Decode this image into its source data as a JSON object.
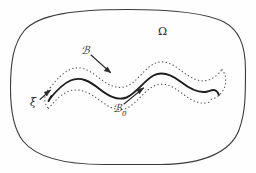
{
  "figure": {
    "kind": "mathematical-diagram",
    "caption_text": "",
    "background_color": "#fefefe",
    "stroke_color": "#3a3a3a",
    "dotted_color": "#5a5a5a",
    "label_color": "#2b2b2b",
    "labels": {
      "domain": "Ω",
      "tube": "ℬ",
      "curve": "ℬ",
      "curve_subscript": "0",
      "point": "ξ"
    },
    "label_names": {
      "domain": "omega-domain-label",
      "tube": "script-k-tube-label",
      "curve": "script-k-zero-curve-label",
      "point": "xi-point-label"
    },
    "elements": {
      "outer_boundary": "blob-domain-outline",
      "solid_curve": "wavy-solid-curve",
      "upper_dotted": "upper-dotted-tube-boundary",
      "lower_dotted": "lower-dotted-tube-boundary",
      "arrow_to_tube": "arrow-from-kappa-to-tube",
      "arrow_to_curve": "arrow-from-kappa-zero-to-curve",
      "arrow_to_point": "arrow-from-xi-to-endpoint"
    },
    "geometry": {
      "width": 256,
      "height": 173,
      "blob_bounds": [
        11,
        9,
        245,
        165
      ],
      "curve_start": [
        50,
        98
      ],
      "curve_end": [
        219,
        95
      ],
      "tube_halfwidth": 11
    }
  }
}
